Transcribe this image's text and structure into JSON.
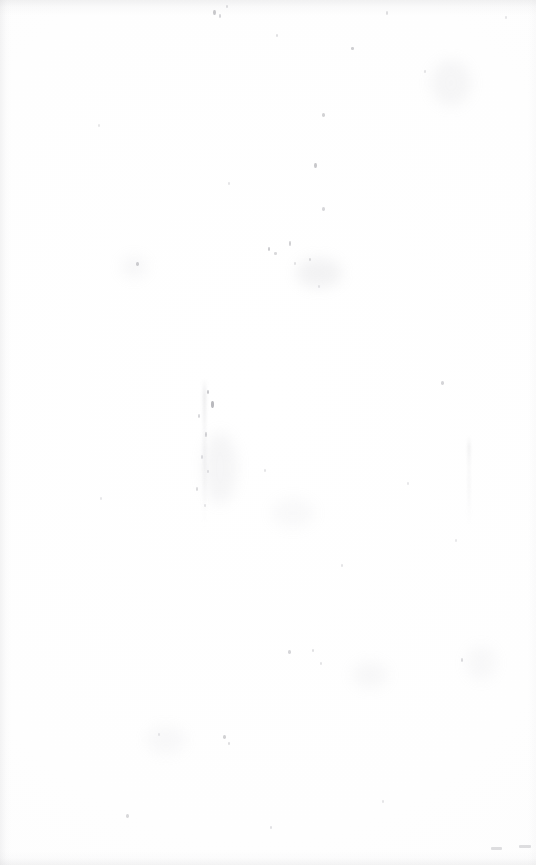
{
  "page": {
    "kind": "scanned-document-page",
    "content_state": "blank",
    "orientation": "portrait",
    "width_px": 536,
    "height_px": 865,
    "paper_color": "#fefefe",
    "background_color": "#ffffff",
    "visible_text": ""
  },
  "edges": {
    "top_band_color": "#aaaaaf",
    "left_band_color": "#afafb4",
    "bottom_band_color": "#b2b2b7",
    "right_band_color": "#c3c3c8"
  },
  "blemishes": {
    "smudges": [
      {
        "x": 296,
        "y": 258,
        "w": 46,
        "h": 30,
        "color": "#bcbcc2",
        "opacity": 0.18
      },
      {
        "x": 203,
        "y": 432,
        "w": 34,
        "h": 72,
        "color": "#c0c0c6",
        "opacity": 0.15
      },
      {
        "x": 121,
        "y": 256,
        "w": 26,
        "h": 22,
        "color": "#c6c6cc",
        "opacity": 0.13
      },
      {
        "x": 431,
        "y": 60,
        "w": 40,
        "h": 46,
        "color": "#c2c2c8",
        "opacity": 0.14
      },
      {
        "x": 146,
        "y": 726,
        "w": 40,
        "h": 28,
        "color": "#c8c8ce",
        "opacity": 0.11
      },
      {
        "x": 352,
        "y": 662,
        "w": 36,
        "h": 26,
        "color": "#c5c5cb",
        "opacity": 0.12
      },
      {
        "x": 271,
        "y": 498,
        "w": 44,
        "h": 30,
        "color": "#c9c9cf",
        "opacity": 0.1
      },
      {
        "x": 466,
        "y": 646,
        "w": 30,
        "h": 34,
        "color": "#c7c7cd",
        "opacity": 0.11
      }
    ],
    "specks": [
      {
        "x": 213,
        "y": 10,
        "w": 3,
        "h": 5,
        "color": "#9b9ba1",
        "opacity": 0.55
      },
      {
        "x": 219,
        "y": 14,
        "w": 2,
        "h": 4,
        "color": "#a5a5ab",
        "opacity": 0.45
      },
      {
        "x": 226,
        "y": 5,
        "w": 2,
        "h": 3,
        "color": "#aeaeb4",
        "opacity": 0.4
      },
      {
        "x": 276,
        "y": 34,
        "w": 2,
        "h": 3,
        "color": "#b0b0b6",
        "opacity": 0.38
      },
      {
        "x": 351,
        "y": 47,
        "w": 3,
        "h": 3,
        "color": "#9f9fa5",
        "opacity": 0.5
      },
      {
        "x": 386,
        "y": 11,
        "w": 2,
        "h": 4,
        "color": "#acacb2",
        "opacity": 0.4
      },
      {
        "x": 424,
        "y": 70,
        "w": 2,
        "h": 3,
        "color": "#b2b2b8",
        "opacity": 0.35
      },
      {
        "x": 505,
        "y": 16,
        "w": 2,
        "h": 3,
        "color": "#b4b4ba",
        "opacity": 0.33
      },
      {
        "x": 322,
        "y": 113,
        "w": 3,
        "h": 4,
        "color": "#a2a2a8",
        "opacity": 0.48
      },
      {
        "x": 98,
        "y": 124,
        "w": 2,
        "h": 3,
        "color": "#b6b6bc",
        "opacity": 0.32
      },
      {
        "x": 314,
        "y": 163,
        "w": 3,
        "h": 5,
        "color": "#9a9aa0",
        "opacity": 0.55
      },
      {
        "x": 228,
        "y": 182,
        "w": 2,
        "h": 3,
        "color": "#b3b3b9",
        "opacity": 0.34
      },
      {
        "x": 322,
        "y": 207,
        "w": 3,
        "h": 4,
        "color": "#a6a6ac",
        "opacity": 0.45
      },
      {
        "x": 268,
        "y": 247,
        "w": 2,
        "h": 4,
        "color": "#9d9da3",
        "opacity": 0.52
      },
      {
        "x": 274,
        "y": 252,
        "w": 3,
        "h": 3,
        "color": "#a8a8ae",
        "opacity": 0.44
      },
      {
        "x": 289,
        "y": 241,
        "w": 2,
        "h": 5,
        "color": "#a0a0a6",
        "opacity": 0.5
      },
      {
        "x": 294,
        "y": 262,
        "w": 2,
        "h": 3,
        "color": "#b1b1b7",
        "opacity": 0.36
      },
      {
        "x": 309,
        "y": 258,
        "w": 2,
        "h": 3,
        "color": "#aaaab0",
        "opacity": 0.4
      },
      {
        "x": 136,
        "y": 262,
        "w": 3,
        "h": 4,
        "color": "#9e9ea4",
        "opacity": 0.5
      },
      {
        "x": 318,
        "y": 285,
        "w": 2,
        "h": 3,
        "color": "#b5b5bb",
        "opacity": 0.32
      },
      {
        "x": 441,
        "y": 381,
        "w": 3,
        "h": 4,
        "color": "#a3a3a9",
        "opacity": 0.46
      },
      {
        "x": 207,
        "y": 390,
        "w": 2,
        "h": 4,
        "color": "#9c9ca2",
        "opacity": 0.54
      },
      {
        "x": 211,
        "y": 401,
        "w": 3,
        "h": 7,
        "color": "#8e8e95",
        "opacity": 0.62
      },
      {
        "x": 198,
        "y": 414,
        "w": 2,
        "h": 4,
        "color": "#a7a7ad",
        "opacity": 0.44
      },
      {
        "x": 205,
        "y": 432,
        "w": 2,
        "h": 5,
        "color": "#a1a1a7",
        "opacity": 0.48
      },
      {
        "x": 201,
        "y": 455,
        "w": 2,
        "h": 4,
        "color": "#adadb3",
        "opacity": 0.4
      },
      {
        "x": 207,
        "y": 470,
        "w": 2,
        "h": 3,
        "color": "#b0b0b6",
        "opacity": 0.36
      },
      {
        "x": 196,
        "y": 487,
        "w": 2,
        "h": 4,
        "color": "#a9a9af",
        "opacity": 0.42
      },
      {
        "x": 204,
        "y": 504,
        "w": 2,
        "h": 3,
        "color": "#b3b3b9",
        "opacity": 0.34
      },
      {
        "x": 100,
        "y": 497,
        "w": 2,
        "h": 3,
        "color": "#b6b6bc",
        "opacity": 0.31
      },
      {
        "x": 264,
        "y": 469,
        "w": 2,
        "h": 3,
        "color": "#b2b2b8",
        "opacity": 0.34
      },
      {
        "x": 407,
        "y": 482,
        "w": 2,
        "h": 3,
        "color": "#b4b4ba",
        "opacity": 0.32
      },
      {
        "x": 341,
        "y": 564,
        "w": 2,
        "h": 3,
        "color": "#b1b1b7",
        "opacity": 0.35
      },
      {
        "x": 455,
        "y": 539,
        "w": 2,
        "h": 3,
        "color": "#b5b5bb",
        "opacity": 0.31
      },
      {
        "x": 288,
        "y": 650,
        "w": 3,
        "h": 4,
        "color": "#a4a4aa",
        "opacity": 0.45
      },
      {
        "x": 312,
        "y": 649,
        "w": 2,
        "h": 3,
        "color": "#afafb5",
        "opacity": 0.38
      },
      {
        "x": 461,
        "y": 658,
        "w": 2,
        "h": 4,
        "color": "#a8a8ae",
        "opacity": 0.42
      },
      {
        "x": 320,
        "y": 662,
        "w": 2,
        "h": 3,
        "color": "#b2b2b8",
        "opacity": 0.34
      },
      {
        "x": 223,
        "y": 735,
        "w": 3,
        "h": 4,
        "color": "#a0a0a6",
        "opacity": 0.48
      },
      {
        "x": 228,
        "y": 742,
        "w": 2,
        "h": 3,
        "color": "#acacb2",
        "opacity": 0.39
      },
      {
        "x": 158,
        "y": 733,
        "w": 2,
        "h": 3,
        "color": "#b4b4ba",
        "opacity": 0.32
      },
      {
        "x": 126,
        "y": 814,
        "w": 3,
        "h": 4,
        "color": "#a6a6ac",
        "opacity": 0.43
      },
      {
        "x": 270,
        "y": 826,
        "w": 2,
        "h": 3,
        "color": "#b0b0b6",
        "opacity": 0.36
      },
      {
        "x": 382,
        "y": 800,
        "w": 2,
        "h": 3,
        "color": "#b3b3b9",
        "opacity": 0.33
      }
    ],
    "streaks": [
      {
        "x": 203,
        "y": 378,
        "w": 3,
        "h": 150
      },
      {
        "x": 468,
        "y": 436,
        "w": 2,
        "h": 92
      }
    ],
    "corner_marks": [
      {
        "x": 491,
        "y": 847,
        "w": 11,
        "h": 3
      },
      {
        "x": 519,
        "y": 845,
        "w": 12,
        "h": 3
      }
    ]
  }
}
